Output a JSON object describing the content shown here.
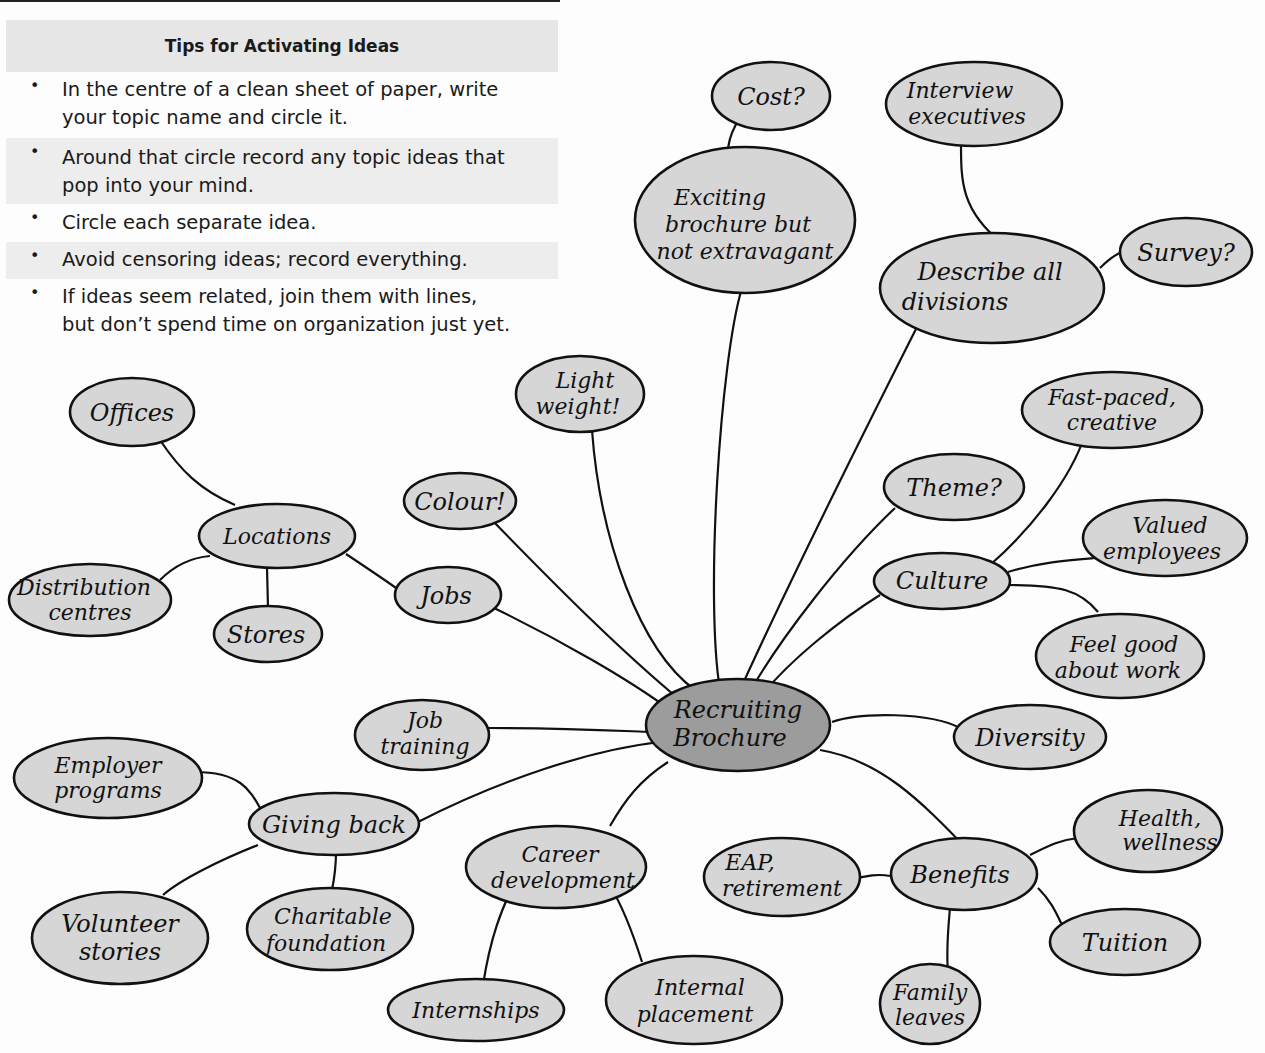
{
  "tips": {
    "title": "Tips for Activating Ideas",
    "items": [
      {
        "line1": "In the centre of a clean sheet of paper, write",
        "line2": "your topic name and circle it."
      },
      {
        "line1": "Around that circle record any topic ideas that",
        "line2": "pop into your mind."
      },
      {
        "line1": "Circle each separate idea.",
        "line2": ""
      },
      {
        "line1": "Avoid censoring ideas; record everything.",
        "line2": ""
      },
      {
        "line1": "If ideas seem related, join them with lines,",
        "line2": "but don’t spend time on organization just yet."
      }
    ],
    "bullet": "•"
  },
  "mindmap": {
    "colors": {
      "node_fill": "#d6d6d6",
      "center_fill": "#9c9c9c",
      "stroke": "#111111"
    },
    "center": {
      "line1": "Recruiting",
      "line2": "Brochure"
    },
    "nodes": {
      "cost": {
        "line1": "Cost?"
      },
      "exciting": {
        "line1": "Exciting",
        "line2": "brochure but",
        "line3": "not extravagant"
      },
      "interview": {
        "line1": "Interview",
        "line2": "executives"
      },
      "describe": {
        "line1": "Describe all",
        "line2": "divisions"
      },
      "survey": {
        "line1": "Survey?"
      },
      "offices": {
        "line1": "Offices"
      },
      "locations": {
        "line1": "Locations"
      },
      "distribution": {
        "line1": "Distribution",
        "line2": "centres"
      },
      "stores": {
        "line1": "Stores"
      },
      "jobs": {
        "line1": "Jobs"
      },
      "colour": {
        "line1": "Colour!"
      },
      "lightweight": {
        "line1": "Light",
        "line2": "weight!"
      },
      "theme": {
        "line1": "Theme?"
      },
      "fastpaced": {
        "line1": "Fast-paced,",
        "line2": "creative"
      },
      "culture": {
        "line1": "Culture"
      },
      "valued": {
        "line1": "Valued",
        "line2": "employees"
      },
      "feelgood": {
        "line1": "Feel good",
        "line2": "about work"
      },
      "diversity": {
        "line1": "Diversity"
      },
      "jobtraining": {
        "line1": "Job",
        "line2": "training"
      },
      "employer": {
        "line1": "Employer",
        "line2": "programs"
      },
      "givingback": {
        "line1": "Giving back"
      },
      "volunteer": {
        "line1": "Volunteer",
        "line2": "stories"
      },
      "charitable": {
        "line1": "Charitable",
        "line2": "foundation"
      },
      "career": {
        "line1": "Career",
        "line2": "development"
      },
      "internships": {
        "line1": "Internships"
      },
      "internal": {
        "line1": "Internal",
        "line2": "placement"
      },
      "eap": {
        "line1": "EAP,",
        "line2": "retirement"
      },
      "benefits": {
        "line1": "Benefits"
      },
      "health": {
        "line1": "Health,",
        "line2": "wellness"
      },
      "tuition": {
        "line1": "Tuition"
      },
      "family": {
        "line1": "Family",
        "line2": "leaves"
      }
    }
  }
}
